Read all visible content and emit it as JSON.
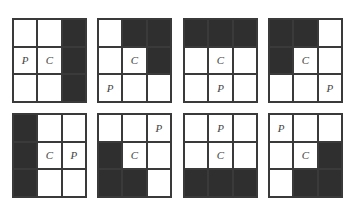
{
  "colors": {
    "filled": "#2f2f2f",
    "empty": "#ffffff",
    "line": "#3a3a3a"
  },
  "grids": [
    {
      "cells": [
        [
          "",
          "",
          "#"
        ],
        [
          "P",
          "C",
          "#"
        ],
        [
          "",
          "",
          "#"
        ]
      ]
    },
    {
      "cells": [
        [
          "",
          "#",
          "#"
        ],
        [
          "",
          "C",
          "#"
        ],
        [
          "P",
          "",
          ""
        ]
      ]
    },
    {
      "cells": [
        [
          "#",
          "#",
          "#"
        ],
        [
          "",
          "C",
          ""
        ],
        [
          "",
          "P",
          ""
        ]
      ]
    },
    {
      "cells": [
        [
          "#",
          "#",
          ""
        ],
        [
          "#",
          "C",
          ""
        ],
        [
          "",
          "",
          "P"
        ]
      ]
    },
    {
      "cells": [
        [
          "#",
          "",
          ""
        ],
        [
          "#",
          "C",
          "P"
        ],
        [
          "#",
          "",
          ""
        ]
      ]
    },
    {
      "cells": [
        [
          "",
          "",
          "P"
        ],
        [
          "#",
          "C",
          ""
        ],
        [
          "#",
          "#",
          ""
        ]
      ]
    },
    {
      "cells": [
        [
          "",
          "P",
          ""
        ],
        [
          "",
          "C",
          ""
        ],
        [
          "#",
          "#",
          "#"
        ]
      ]
    },
    {
      "cells": [
        [
          "P",
          "",
          ""
        ],
        [
          "",
          "C",
          "#"
        ],
        [
          "",
          "#",
          "#"
        ]
      ]
    }
  ],
  "layout": [
    {
      "left": 12,
      "top": 18
    },
    {
      "left": 97,
      "top": 18
    },
    {
      "left": 183,
      "top": 18
    },
    {
      "left": 268,
      "top": 18
    },
    {
      "left": 12,
      "top": 113
    },
    {
      "left": 97,
      "top": 113
    },
    {
      "left": 183,
      "top": 113
    },
    {
      "left": 268,
      "top": 113
    }
  ]
}
